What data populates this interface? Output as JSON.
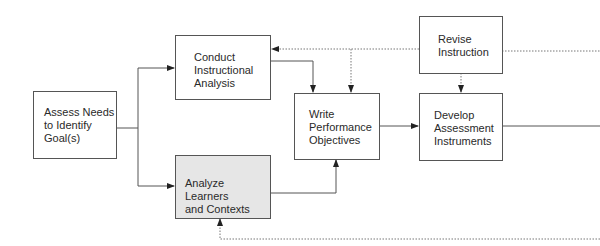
{
  "diagram": {
    "type": "flowchart",
    "colors": {
      "line": "#555555",
      "box_fill": "#ffffff",
      "shaded_fill": "#e6e6e6",
      "text": "#2a2a2a"
    },
    "nodes": [
      {
        "id": "assess",
        "label": "Assess Needs\nto Identify\nGoal(s)",
        "shaded": false
      },
      {
        "id": "conduct",
        "label": "Conduct\nInstructional\nAnalysis",
        "shaded": false
      },
      {
        "id": "analyze",
        "label": "Analyze Learners\nand Contexts",
        "shaded": true
      },
      {
        "id": "write",
        "label": "Write\nPerformance\nObjectives",
        "shaded": false
      },
      {
        "id": "revise",
        "label": "Revise\nInstruction",
        "shaded": false
      },
      {
        "id": "develop",
        "label": "Develop\nAssessment\nInstruments",
        "shaded": false
      }
    ],
    "edges": [
      {
        "from": "assess",
        "to": "conduct",
        "style": "solid"
      },
      {
        "from": "assess",
        "to": "analyze",
        "style": "solid"
      },
      {
        "from": "conduct",
        "to": "write",
        "style": "solid"
      },
      {
        "from": "analyze",
        "to": "write",
        "style": "solid"
      },
      {
        "from": "write",
        "to": "develop",
        "style": "solid"
      },
      {
        "from": "develop",
        "to": "off-canvas-right",
        "style": "solid"
      },
      {
        "from": "revise",
        "to": "conduct",
        "style": "dotted"
      },
      {
        "from": "revise",
        "to": "write",
        "style": "dotted"
      },
      {
        "from": "revise",
        "to": "develop",
        "style": "dotted"
      },
      {
        "from": "off-canvas-right",
        "to": "revise",
        "style": "dotted"
      },
      {
        "from": "off-canvas-right",
        "to": "analyze",
        "style": "dotted"
      }
    ]
  }
}
